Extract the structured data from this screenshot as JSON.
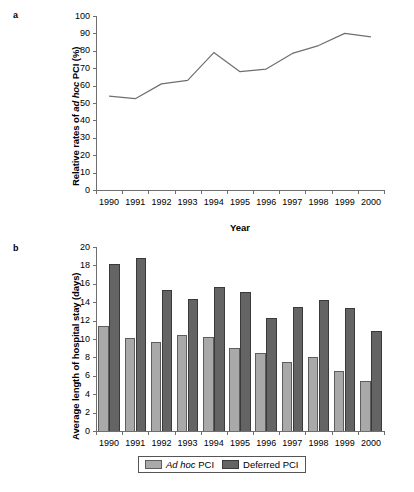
{
  "figure": {
    "panel_a_label": "a",
    "panel_b_label": "b"
  },
  "chart_data": [
    {
      "id": "panel-a",
      "type": "line",
      "title": "",
      "xlabel": "Year",
      "ylabel": "Relative rates of ad hoc PCI (%)",
      "ylabel_italic_part": "ad hoc",
      "categories": [
        "1990",
        "1991",
        "1992",
        "1993",
        "1994",
        "1995",
        "1996",
        "1997",
        "1998",
        "1999",
        "2000"
      ],
      "x": [
        1990,
        1991,
        1992,
        1993,
        1994,
        1995,
        1996,
        1997,
        1998,
        1999,
        2000
      ],
      "values": [
        54,
        52.5,
        61,
        63,
        79,
        68,
        69.5,
        78.5,
        83,
        90,
        88
      ],
      "ylim": [
        0,
        100
      ],
      "ytick_labels": [
        "100",
        "90",
        "80",
        "70",
        "60",
        "50",
        "40",
        "30",
        "20",
        "10",
        "0"
      ],
      "ytick_values": [
        100,
        90,
        80,
        70,
        60,
        50,
        40,
        30,
        20,
        10,
        0
      ],
      "ystep": 10,
      "grid": false,
      "legend": false,
      "line_color": "#6f6f6f"
    },
    {
      "id": "panel-b",
      "type": "bar",
      "title": "",
      "xlabel": "",
      "ylabel": "Average length of hospital stay (days)",
      "categories": [
        "1990",
        "1991",
        "1992",
        "1993",
        "1994",
        "1995",
        "1996",
        "1997",
        "1998",
        "1999",
        "2000"
      ],
      "series": [
        {
          "name": "Ad hoc PCI",
          "name_italic_part": "Ad hoc",
          "color": "#a9a9a9",
          "values": [
            11.4,
            10.1,
            9.7,
            10.4,
            10.2,
            9.0,
            8.5,
            7.5,
            8.0,
            6.5,
            5.4
          ]
        },
        {
          "name": "Deferred PCI",
          "color": "#646464",
          "values": [
            18.2,
            18.8,
            15.3,
            14.3,
            15.6,
            15.1,
            12.3,
            13.5,
            14.25,
            13.4,
            10.9
          ]
        }
      ],
      "ylim": [
        0,
        20
      ],
      "ytick_labels": [
        "20",
        "18",
        "16",
        "14",
        "12",
        "10",
        "8",
        "6",
        "4",
        "2",
        "0"
      ],
      "ytick_values": [
        20,
        18,
        16,
        14,
        12,
        10,
        8,
        6,
        4,
        2,
        0
      ],
      "ystep": 2,
      "grid": false,
      "legend": true,
      "legend_position": "bottom-center"
    }
  ]
}
